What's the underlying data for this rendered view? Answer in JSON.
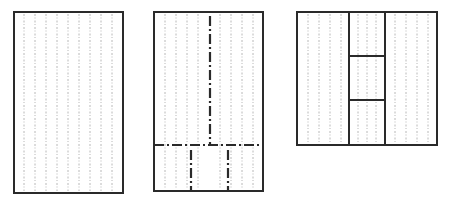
{
  "diagram": {
    "panels": [
      {
        "name": "plain-panel",
        "x": 14,
        "y": 12,
        "w": 109,
        "h": 181
      },
      {
        "name": "dashdot-division-panel",
        "x": 154,
        "y": 12,
        "w": 109,
        "h": 179,
        "horizontal_cut_y": 145,
        "upper_vertical_x": 210,
        "lower_verticals_x": [
          191,
          228
        ]
      },
      {
        "name": "inset-panel",
        "x": 297,
        "y": 12,
        "w": 140,
        "h": 133,
        "verticals_x": [
          349,
          385
        ],
        "inset_box": {
          "y1": 56,
          "y2": 100
        }
      }
    ],
    "colors": {
      "line": "#2a2a2a",
      "grain": "#b8b8b8",
      "background": "#ffffff"
    }
  }
}
